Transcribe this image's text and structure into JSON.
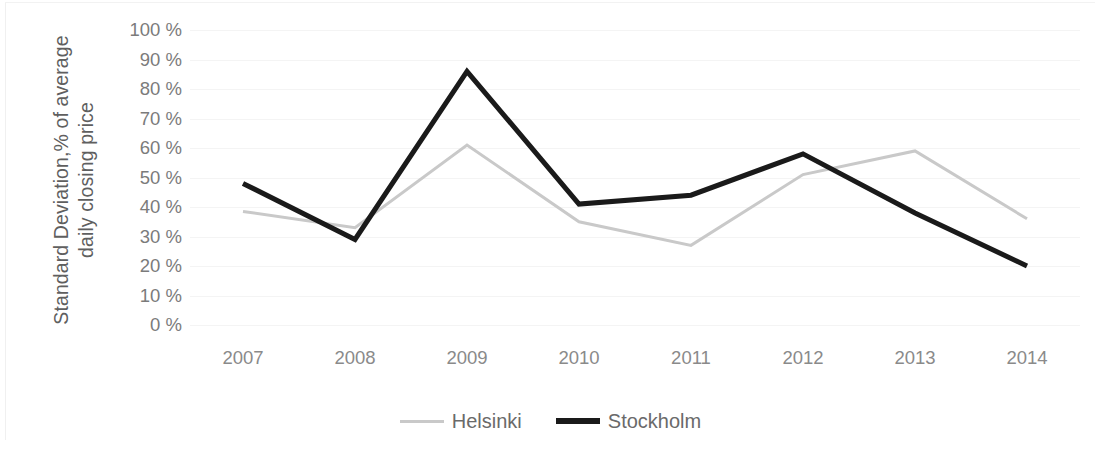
{
  "chart_data": {
    "type": "line",
    "title": "",
    "xlabel": "",
    "ylabel": "Standard Deviation,% of average daily closing price",
    "ylabel_line1": "Standard Deviation,% of average",
    "ylabel_line2": "daily closing price",
    "categories": [
      "2007",
      "2008",
      "2009",
      "2010",
      "2011",
      "2012",
      "2013",
      "2014"
    ],
    "ylim": [
      0,
      100
    ],
    "ytick_values": [
      100,
      90,
      80,
      70,
      60,
      50,
      40,
      30,
      20,
      10,
      0
    ],
    "ytick_labels": [
      "100 %",
      "90 %",
      "80 %",
      "70 %",
      "60 %",
      "50 %",
      "40 %",
      "30 %",
      "20 %",
      "10 %",
      "0 %"
    ],
    "grid": true,
    "legend_position": "bottom",
    "series": [
      {
        "name": "Helsinki",
        "color": "#c9c9c9",
        "width": 3,
        "values": [
          38.5,
          33,
          61,
          35,
          27,
          51,
          59,
          36
        ]
      },
      {
        "name": "Stockholm",
        "color": "#1a1a1a",
        "width": 5,
        "values": [
          48,
          29,
          86,
          41,
          44,
          58,
          38,
          20
        ]
      }
    ]
  },
  "legend": {
    "items": [
      {
        "label": "Helsinki",
        "swatch": "helsinki-line-swatch"
      },
      {
        "label": "Stockholm",
        "swatch": "stockholm-line-swatch"
      }
    ]
  }
}
